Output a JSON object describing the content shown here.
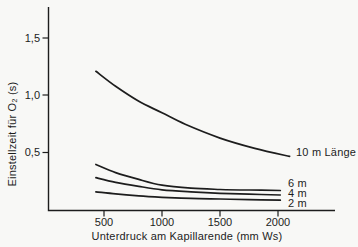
{
  "axes": {
    "y_label": "Einstellzeit für O₂ (s)",
    "x_label": "Unterdruck am Kapillarende (mm Ws)",
    "y_tick_labels": [
      "1,5",
      "1,0",
      "0,5"
    ],
    "x_tick_labels": [
      "500",
      "1000",
      "1500",
      "2000"
    ]
  },
  "line_labels": {
    "l10": "10 m Länge",
    "l6": "6 m",
    "l4": "4 m",
    "l2": "2 m"
  },
  "colors": {
    "ink": "#1d1d1d",
    "background": "#f8f8f6"
  },
  "chart_data": {
    "type": "line",
    "title": "",
    "xlabel": "Unterdruck am Kapillarende (mm Ws)",
    "ylabel": "Einstellzeit für O₂ (s)",
    "xlim": [
      0,
      2450
    ],
    "ylim": [
      0,
      1.77
    ],
    "x_tick_values": [
      500,
      1000,
      1500,
      2000
    ],
    "y_tick_values": [
      0.5,
      1.0,
      1.5
    ],
    "grid": false,
    "legend_position": "labels-at-line-ends",
    "series": [
      {
        "name": "10 m Länge",
        "x": [
          430,
          600,
          800,
          1000,
          1200,
          1500,
          1800,
          2100
        ],
        "y": [
          1.21,
          1.08,
          0.95,
          0.85,
          0.75,
          0.63,
          0.54,
          0.47
        ]
      },
      {
        "name": "6 m",
        "x": [
          430,
          600,
          800,
          1000,
          1250,
          1500,
          1750,
          2020
        ],
        "y": [
          0.4,
          0.33,
          0.27,
          0.22,
          0.195,
          0.183,
          0.178,
          0.174
        ]
      },
      {
        "name": "4 m",
        "x": [
          430,
          600,
          800,
          1000,
          1250,
          1500,
          1750,
          2020
        ],
        "y": [
          0.285,
          0.245,
          0.21,
          0.18,
          0.162,
          0.15,
          0.142,
          0.135
        ]
      },
      {
        "name": "2 m",
        "x": [
          430,
          600,
          800,
          1000,
          1250,
          1500,
          1750,
          2020
        ],
        "y": [
          0.163,
          0.145,
          0.128,
          0.115,
          0.105,
          0.1,
          0.094,
          0.09
        ]
      }
    ]
  }
}
